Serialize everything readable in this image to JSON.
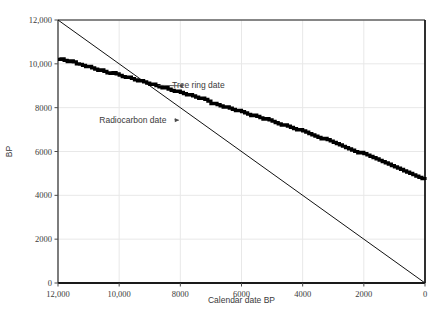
{
  "chart_data": {
    "type": "line",
    "title": "",
    "xlabel": "Calendar date BP",
    "ylabel": "BP",
    "xlim": [
      12000,
      0
    ],
    "ylim": [
      0,
      12000
    ],
    "x_reversed": true,
    "grid": true,
    "legend_position": "none",
    "xticks": [
      12000,
      10000,
      8000,
      6000,
      4000,
      2000,
      0
    ],
    "xtick_labels": [
      "12,000",
      "10,000",
      "8000",
      "6000",
      "4000",
      "2000",
      "0"
    ],
    "yticks": [
      0,
      2000,
      4000,
      6000,
      8000,
      10000,
      12000
    ],
    "ytick_labels": [
      "0",
      "2000",
      "4000",
      "6000",
      "8000",
      "10,000",
      "12,000"
    ],
    "annotations": [
      {
        "text": "Tree ring date",
        "label_x": 6550,
        "label_y": 9020,
        "leader_to_x": 8050,
        "leader_to_y": 9000
      },
      {
        "text": "Radiocarbon date",
        "label_x": 10650,
        "label_y": 7450,
        "leader_to_x": 8050,
        "leader_to_y": 7430
      }
    ],
    "series": [
      {
        "name": "Tree ring date",
        "style": "thin-straight",
        "color": "#111111",
        "x": [
          12000,
          0
        ],
        "values": [
          12000,
          0
        ]
      },
      {
        "name": "Radiocarbon date",
        "style": "thick-jagged",
        "color": "#000000",
        "x": [
          12000,
          11900,
          11800,
          11700,
          11600,
          11500,
          11400,
          11300,
          11200,
          11100,
          11000,
          10900,
          10800,
          10700,
          10600,
          10500,
          10400,
          10300,
          10200,
          10100,
          10000,
          9900,
          9800,
          9700,
          9600,
          9500,
          9400,
          9300,
          9200,
          9100,
          9000,
          8900,
          8800,
          8700,
          8600,
          8500,
          8400,
          8300,
          8200,
          8100,
          8000,
          7900,
          7800,
          7700,
          7600,
          7500,
          7400,
          7300,
          7200,
          7100,
          7000,
          6900,
          6800,
          6700,
          6600,
          6500,
          6400,
          6300,
          6200,
          6100,
          6000,
          5900,
          5800,
          5700,
          5600,
          5500,
          5400,
          5300,
          5200,
          5100,
          5000,
          4900,
          4800,
          4700,
          4600,
          4500,
          4400,
          4300,
          4200,
          4100,
          4000,
          3900,
          3800,
          3700,
          3600,
          3500,
          3400,
          3300,
          3200,
          3100,
          3000,
          2900,
          2800,
          2700,
          2600,
          2500,
          2400,
          2300,
          2200,
          2100,
          2000,
          1900,
          1800,
          1700,
          1600,
          1500,
          1400,
          1300,
          1200,
          1100,
          1000,
          900,
          800,
          700,
          600,
          500,
          400,
          300,
          200,
          100,
          0
        ],
        "values": [
          10200,
          10230,
          10160,
          10100,
          10140,
          10090,
          10000,
          9980,
          9930,
          9870,
          9890,
          9820,
          9760,
          9700,
          9720,
          9660,
          9590,
          9560,
          9600,
          9540,
          9480,
          9420,
          9380,
          9400,
          9330,
          9270,
          9220,
          9240,
          9180,
          9120,
          9060,
          9080,
          9010,
          8950,
          8900,
          8920,
          8850,
          8790,
          8740,
          8760,
          8700,
          8640,
          8580,
          8600,
          8540,
          8480,
          8420,
          8440,
          8380,
          8300,
          8180,
          8200,
          8140,
          8080,
          8020,
          8040,
          7980,
          7920,
          7860,
          7880,
          7820,
          7760,
          7700,
          7640,
          7660,
          7600,
          7540,
          7480,
          7500,
          7440,
          7380,
          7320,
          7260,
          7200,
          7220,
          7160,
          7100,
          7040,
          6980,
          7000,
          6940,
          6880,
          6820,
          6760,
          6700,
          6640,
          6580,
          6600,
          6540,
          6480,
          6420,
          6360,
          6300,
          6240,
          6180,
          6120,
          6060,
          6000,
          5940,
          5960,
          5900,
          5840,
          5780,
          5720,
          5660,
          5600,
          5540,
          5480,
          5420,
          5360,
          5300,
          5240,
          5180,
          5120,
          5060,
          5000,
          4940,
          4880,
          4820,
          4760,
          4700
        ]
      }
    ],
    "series_curve_note": "Radiocarbon curve plotted against calendar date; values listed above are sampled radiocarbon ages at each calendar date.",
    "colors": {
      "plot_border": "#1a1a1a",
      "grid": "#e8e8e8",
      "text": "#3a3a3a",
      "curve": "#000000",
      "straight_line": "#111111"
    }
  }
}
